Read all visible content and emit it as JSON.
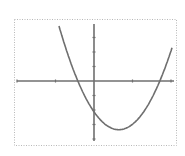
{
  "chart_data": {
    "type": "line",
    "title": "",
    "xlabel": "",
    "ylabel": "",
    "function": "y = 2.96*(x + 0.416)*(x - 1.714)",
    "x_intercepts": [
      -0.42,
      1.71
    ],
    "y_intercept": -2.1,
    "vertex": [
      0.65,
      -3.1
    ],
    "xlim": [
      -2,
      2
    ],
    "ylim": [
      -4,
      4
    ],
    "x_ticks": [
      -2,
      -1,
      0,
      1,
      2
    ],
    "y_ticks": [
      -4,
      -3,
      -2,
      -1,
      0,
      1,
      2,
      3,
      4
    ],
    "grid": false,
    "legend": null,
    "series": [
      {
        "name": "f(x)",
        "x": [
          -0.91,
          -0.75,
          -0.5,
          -0.25,
          0,
          0.25,
          0.5,
          0.65,
          0.75,
          1.0,
          1.25,
          1.5,
          1.71,
          1.95
        ],
        "y": [
          3.9,
          2.7,
          1.0,
          -0.8,
          -2.1,
          -2.9,
          -3.2,
          -3.1,
          -3.1,
          -2.9,
          -2.3,
          -1.5,
          0.0,
          0.8
        ]
      }
    ],
    "colors": {
      "curve": "#6f6f6f",
      "axes": "#6f6f6f",
      "border": "#b8b8b8",
      "background": "#ffffff"
    }
  },
  "layout": {
    "frame": {
      "left": 14,
      "top": 19,
      "right": 176,
      "bottom": 145
    },
    "origin_px": [
      94,
      81
    ],
    "x_tick_spacing_px": 38.5,
    "y_tick_spacing_px": 14.5,
    "x_axis_px_range": [
      17,
      174
    ],
    "y_axis_px_range": [
      24,
      141
    ]
  }
}
